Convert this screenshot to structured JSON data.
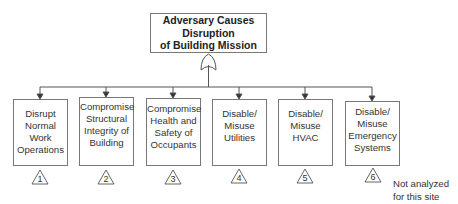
{
  "top_event": {
    "lines": [
      "Adversary Causes",
      "Disruption",
      "of Building Mission"
    ],
    "gate": "OR"
  },
  "nodes": [
    {
      "lines": [
        "Disrupt",
        "Normal",
        "Work",
        "Operations"
      ],
      "id": "1"
    },
    {
      "lines": [
        "Compromise",
        "Structural",
        "Integrity of",
        "Building"
      ],
      "id": "2"
    },
    {
      "lines": [
        "Compromise",
        "Health and",
        "Safety of",
        "Occupants"
      ],
      "id": "3"
    },
    {
      "lines": [
        "Disable/",
        "Misuse",
        "Utilities"
      ],
      "id": "4"
    },
    {
      "lines": [
        "Disable/",
        "Misuse",
        "HVAC"
      ],
      "id": "5"
    },
    {
      "lines": [
        "Disable/",
        "Misuse",
        "Emergency",
        "Systems"
      ],
      "id": "6"
    }
  ],
  "note": {
    "lines": [
      "Not analyzed",
      "for this site"
    ]
  },
  "colors": {
    "line": "#555555",
    "box_border": "#777777"
  }
}
